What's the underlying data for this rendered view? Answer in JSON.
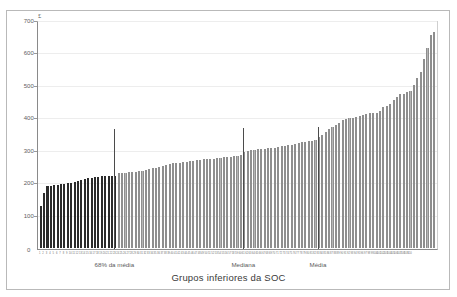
{
  "figure": {
    "currency_symbol": "£",
    "xaxis_title": "Grupos inferiores da  SOC",
    "zero_label": "0"
  },
  "chart_data": {
    "type": "bar",
    "title": "",
    "subtitle": "",
    "xlabel": "Grupos inferiores da  SOC",
    "ylabel": "£",
    "ylim": [
      0,
      700
    ],
    "yticks": [
      0,
      100,
      200,
      300,
      400,
      500,
      600,
      700
    ],
    "ytick_labels": [
      "0",
      "100",
      "200",
      "300",
      "400",
      "500",
      "600",
      "700"
    ],
    "grid": true,
    "legend": "none",
    "bar_colors": {
      "below_threshold": "#2b2b2b",
      "above_threshold": "#b4b4b4"
    },
    "annotations": [
      {
        "label": "68% da média",
        "x_index": 22,
        "value": 372,
        "color": "#4b4b4b"
      },
      {
        "label": "Mediana",
        "x_index": 60,
        "value": 375,
        "color": "#4b4b4b"
      },
      {
        "label": "Média",
        "x_index": 82,
        "value": 380,
        "color": "#4b4b4b"
      }
    ],
    "categories": [
      "1",
      "2",
      "3",
      "4",
      "5",
      "6",
      "7",
      "8",
      "9",
      "10",
      "11",
      "12",
      "13",
      "14",
      "15",
      "16",
      "17",
      "18",
      "19",
      "20",
      "21",
      "22",
      "23",
      "24",
      "25",
      "26",
      "27",
      "28",
      "29",
      "30",
      "31",
      "32",
      "33",
      "34",
      "35",
      "36",
      "37",
      "38",
      "39",
      "40",
      "41",
      "42",
      "43",
      "44",
      "45",
      "46",
      "47",
      "48",
      "49",
      "50",
      "51",
      "52",
      "53",
      "54",
      "55",
      "56",
      "57",
      "58",
      "59",
      "60",
      "61",
      "62",
      "63",
      "64",
      "65",
      "66",
      "67",
      "68",
      "69",
      "70",
      "71",
      "72",
      "73",
      "74",
      "75",
      "76",
      "77",
      "78",
      "79",
      "80",
      "81",
      "82",
      "83",
      "84",
      "85",
      "86",
      "87",
      "88",
      "89",
      "90",
      "91",
      "92",
      "93",
      "94",
      "95",
      "96",
      "97",
      "98",
      "99",
      "100",
      "101",
      "102",
      "103",
      "104",
      "105",
      "106",
      "107",
      "108",
      "109",
      "110"
    ],
    "values": [
      131,
      170,
      192,
      194,
      196,
      196,
      198,
      200,
      202,
      203,
      206,
      209,
      212,
      215,
      218,
      219,
      221,
      222,
      223,
      223,
      224,
      224,
      225,
      232,
      233,
      234,
      236,
      237,
      238,
      239,
      240,
      242,
      245,
      248,
      250,
      251,
      255,
      258,
      260,
      265,
      264,
      266,
      268,
      269,
      271,
      272,
      273,
      275,
      276,
      277,
      277,
      278,
      279,
      281,
      282,
      283,
      284,
      285,
      286,
      288,
      300,
      303,
      305,
      306,
      307,
      308,
      309,
      310,
      311,
      312,
      313,
      316,
      318,
      320,
      322,
      324,
      327,
      329,
      331,
      332,
      334,
      337,
      344,
      353,
      362,
      369,
      378,
      384,
      390,
      397,
      400,
      403,
      404,
      407,
      411,
      415,
      418,
      419,
      419,
      420,
      425,
      440,
      443,
      447,
      461,
      470,
      478,
      480,
      484,
      487
    ],
    "values_tail": [
      507,
      528,
      547,
      588,
      621,
      664,
      671
    ],
    "threshold_bar_index": 22
  }
}
